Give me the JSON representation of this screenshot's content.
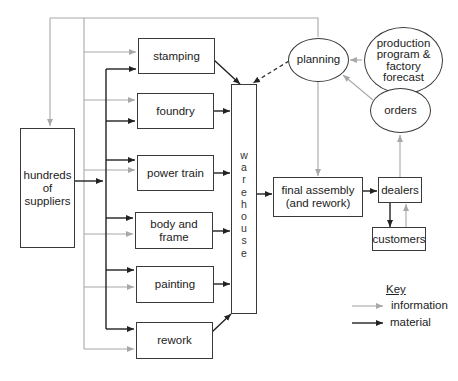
{
  "diagram": {
    "colors": {
      "information": "#a8a8a8",
      "material": "#222222",
      "box_border": "#3a3a3a"
    },
    "nodes": {
      "suppliers": {
        "label_lines": [
          "hundreds",
          "of",
          "suppliers"
        ]
      },
      "stamping": {
        "label": "stamping"
      },
      "foundry": {
        "label": "foundry"
      },
      "power_train": {
        "label": "power train"
      },
      "body_and_frame": {
        "label": "body and frame"
      },
      "painting": {
        "label": "painting"
      },
      "rework": {
        "label": "rework"
      },
      "warehouse": {
        "letters": [
          "w",
          "a",
          "r",
          "e",
          "h",
          "o",
          "u",
          "s",
          "e"
        ]
      },
      "planning": {
        "label": "planning"
      },
      "production_program": {
        "label_lines": [
          "production",
          "program &",
          "factory forecast"
        ]
      },
      "orders": {
        "label": "orders"
      },
      "final_assembly": {
        "label_lines": [
          "final assembly",
          "(and rework)"
        ]
      },
      "dealers": {
        "label": "dealers"
      },
      "customers": {
        "label": "customers"
      }
    },
    "edges": [
      {
        "from": "suppliers",
        "to": "stamping",
        "type": "material"
      },
      {
        "from": "suppliers",
        "to": "foundry",
        "type": "material"
      },
      {
        "from": "suppliers",
        "to": "power_train",
        "type": "material"
      },
      {
        "from": "suppliers",
        "to": "body_and_frame",
        "type": "material"
      },
      {
        "from": "suppliers",
        "to": "painting",
        "type": "material"
      },
      {
        "from": "suppliers",
        "to": "rework",
        "type": "material"
      },
      {
        "from": "stamping",
        "to": "warehouse",
        "type": "material"
      },
      {
        "from": "foundry",
        "to": "warehouse",
        "type": "material"
      },
      {
        "from": "power_train",
        "to": "warehouse",
        "type": "material"
      },
      {
        "from": "body_and_frame",
        "to": "warehouse",
        "type": "material"
      },
      {
        "from": "painting",
        "to": "warehouse",
        "type": "material"
      },
      {
        "from": "rework",
        "to": "warehouse",
        "type": "material"
      },
      {
        "from": "warehouse",
        "to": "final_assembly",
        "type": "material"
      },
      {
        "from": "final_assembly",
        "to": "dealers",
        "type": "material"
      },
      {
        "from": "dealers",
        "to": "customers",
        "type": "material"
      },
      {
        "from": "customers",
        "to": "dealers",
        "type": "information"
      },
      {
        "from": "dealers",
        "to": "orders",
        "type": "information"
      },
      {
        "from": "orders",
        "to": "planning",
        "type": "information"
      },
      {
        "from": "production_program",
        "to": "planning",
        "type": "information"
      },
      {
        "from": "planning",
        "to": "final_assembly",
        "type": "information"
      },
      {
        "from": "planning",
        "to": "warehouse",
        "type": "dashed"
      },
      {
        "from": "planning",
        "to": "suppliers",
        "type": "information"
      },
      {
        "from": "planning",
        "to": "stamping",
        "type": "information"
      },
      {
        "from": "planning",
        "to": "foundry",
        "type": "information"
      },
      {
        "from": "planning",
        "to": "power_train",
        "type": "information"
      },
      {
        "from": "planning",
        "to": "body_and_frame",
        "type": "information"
      },
      {
        "from": "planning",
        "to": "painting",
        "type": "information"
      },
      {
        "from": "planning",
        "to": "rework",
        "type": "information"
      }
    ]
  },
  "key": {
    "title": "Key",
    "items": [
      {
        "label": "information",
        "type": "information"
      },
      {
        "label": "material",
        "type": "material"
      }
    ]
  }
}
